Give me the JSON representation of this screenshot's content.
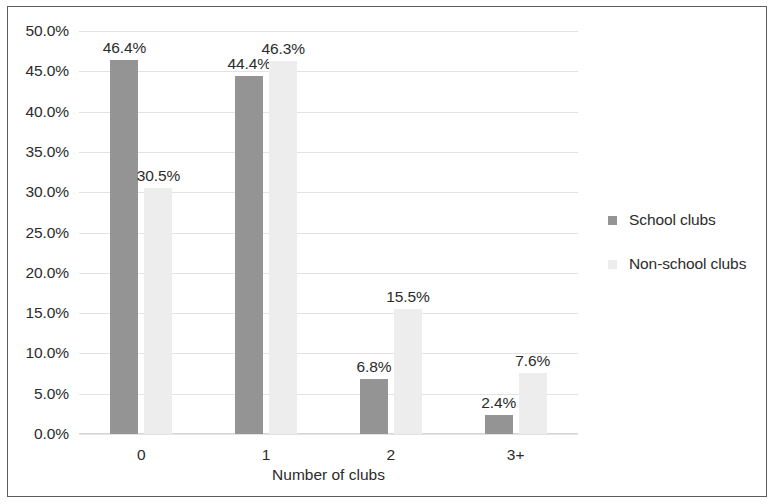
{
  "chart_data": {
    "type": "bar",
    "title": "",
    "xlabel": "Number of clubs",
    "ylabel": "",
    "categories": [
      "0",
      "1",
      "2",
      "3+"
    ],
    "series": [
      {
        "name": "School clubs",
        "color": "#949494",
        "values": [
          46.4,
          44.4,
          6.8,
          2.4
        ],
        "labels": [
          "46.4%",
          "44.4%",
          "6.8%",
          "2.4%"
        ]
      },
      {
        "name": "Non-school clubs",
        "color": "#ededed",
        "values": [
          30.5,
          46.3,
          15.5,
          7.6
        ],
        "labels": [
          "30.5%",
          "46.3%",
          "15.5%",
          "7.6%"
        ]
      }
    ],
    "ylim": [
      0,
      50
    ],
    "ytick_values": [
      50,
      45,
      40,
      35,
      30,
      25,
      20,
      15,
      10,
      5,
      0
    ],
    "ytick_labels": [
      "50.0%",
      "45.0%",
      "40.0%",
      "35.0%",
      "30.0%",
      "25.0%",
      "20.0%",
      "15.0%",
      "10.0%",
      "5.0%",
      "0.0%"
    ],
    "grid": true,
    "legend_position": "right"
  }
}
